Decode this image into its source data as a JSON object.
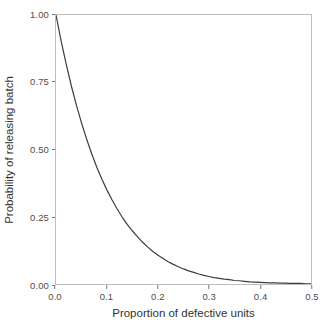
{
  "chart_data": {
    "type": "line",
    "title": "",
    "subtitle": "",
    "xlabel": "Proportion of defective units",
    "ylabel": "Probability of releasing batch",
    "xlim": [
      0.0,
      0.5
    ],
    "ylim": [
      0.0,
      1.0
    ],
    "grid": false,
    "legend": "none",
    "line_color": "#3d3d3d",
    "panel_border_color": "#bdbdbd",
    "panel_background": "#ffffff",
    "axis_text_color": "#4d4d4d",
    "axis_title_color": "#333333",
    "xticks": [
      {
        "value": 0.0,
        "label": "0.0"
      },
      {
        "value": 0.1,
        "label": "0.1"
      },
      {
        "value": 0.2,
        "label": "0.2"
      },
      {
        "value": 0.3,
        "label": "0.3"
      },
      {
        "value": 0.4,
        "label": "0.4"
      },
      {
        "value": 0.5,
        "label": "0.5"
      }
    ],
    "yticks": [
      {
        "value": 0.0,
        "label": "0.00"
      },
      {
        "value": 0.25,
        "label": "0.25"
      },
      {
        "value": 0.5,
        "label": "0.50"
      },
      {
        "value": 0.75,
        "label": "0.75"
      },
      {
        "value": 1.0,
        "label": "1.00"
      }
    ],
    "series": [
      {
        "name": "Operating characteristic curve",
        "x": [
          0.0,
          0.01,
          0.02,
          0.03,
          0.04,
          0.05,
          0.06,
          0.07,
          0.08,
          0.09,
          0.1,
          0.11,
          0.12,
          0.13,
          0.14,
          0.15,
          0.16,
          0.17,
          0.18,
          0.19,
          0.2,
          0.21,
          0.22,
          0.23,
          0.24,
          0.25,
          0.26,
          0.27,
          0.28,
          0.29,
          0.3,
          0.31,
          0.32,
          0.33,
          0.34,
          0.35,
          0.36,
          0.37,
          0.38,
          0.39,
          0.4,
          0.41,
          0.42,
          0.43,
          0.44,
          0.45,
          0.46,
          0.47,
          0.48,
          0.49,
          0.5
        ],
        "y": [
          1.0,
          0.904,
          0.817,
          0.737,
          0.665,
          0.599,
          0.539,
          0.484,
          0.434,
          0.389,
          0.349,
          0.312,
          0.279,
          0.248,
          0.221,
          0.197,
          0.175,
          0.155,
          0.137,
          0.121,
          0.107,
          0.095,
          0.083,
          0.073,
          0.064,
          0.056,
          0.049,
          0.043,
          0.037,
          0.032,
          0.028,
          0.024,
          0.021,
          0.018,
          0.016,
          0.013,
          0.012,
          0.01,
          0.008,
          0.007,
          0.006,
          0.005,
          0.004,
          0.004,
          0.003,
          0.003,
          0.002,
          0.002,
          0.002,
          0.001,
          0.001
        ]
      }
    ]
  }
}
